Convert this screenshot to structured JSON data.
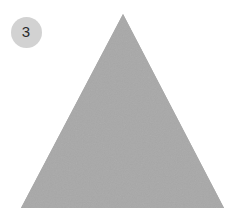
{
  "canvas": {
    "width": 248,
    "height": 219,
    "background_color": "#ffffff"
  },
  "badge": {
    "label": "3",
    "shape": "circle",
    "fill_color": "#d2d2d2",
    "text_color": "#2b2b2b",
    "center_x": 26,
    "center_y": 32,
    "diameter": 31
  },
  "shape": {
    "name": "triangle",
    "sides": 3,
    "fill_color": "#a8a8a8",
    "outline": "none",
    "orientation": "apex-up",
    "vertices": [
      {
        "x": 123,
        "y": 14
      },
      {
        "x": 224,
        "y": 208
      },
      {
        "x": 21,
        "y": 208
      }
    ],
    "apex": {
      "x": 123,
      "y": 14
    },
    "base_left": {
      "x": 21,
      "y": 208
    },
    "base_right": {
      "x": 224,
      "y": 208
    },
    "base_width": 203,
    "height": 194,
    "texture": "subtle-grain"
  }
}
